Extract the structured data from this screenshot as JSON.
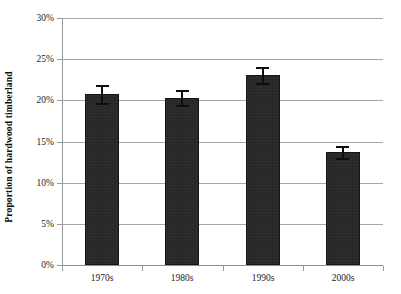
{
  "chart": {
    "title": "",
    "y_axis_title": "Proportion of hardwood timberland",
    "x_axis_title": ""
  },
  "y_ticks": [
    {
      "label": "30%",
      "value": 30
    },
    {
      "label": "25%",
      "value": 25
    },
    {
      "label": "20%",
      "value": 20
    },
    {
      "label": "15%",
      "value": 15
    },
    {
      "label": "10%",
      "value": 10
    },
    {
      "label": "5%",
      "value": 5
    },
    {
      "label": "0%",
      "value": 0
    }
  ],
  "x_labels": [
    "1970s",
    "1980s",
    "1990s",
    "2000s"
  ],
  "chart_data": {
    "type": "bar",
    "title": "",
    "subtitle": "",
    "xlabel": "",
    "ylabel": "Proportion of hardwood timberland",
    "categories": [
      "1970s",
      "1980s",
      "1990s",
      "2000s"
    ],
    "values": [
      20.8,
      20.3,
      23.1,
      13.7
    ],
    "errors": [
      1.1,
      0.9,
      1.0,
      0.7
    ],
    "error_type": "symmetric",
    "unit": "percent",
    "ylim": [
      0,
      30
    ],
    "ytick_values": [
      0,
      5,
      10,
      15,
      20,
      25,
      30
    ],
    "ytick_labels": [
      "0%",
      "5%",
      "10%",
      "15%",
      "20%",
      "25%",
      "30%"
    ],
    "grid": "horizontal",
    "legend": "none",
    "bar_color": "#262626",
    "gridline_color": "#a8a8a8",
    "background_color": "#ffffff",
    "series": [
      {
        "name": "Proportion of hardwood timberland",
        "values": [
          20.8,
          20.3,
          23.1,
          13.7
        ],
        "errors": [
          1.1,
          0.9,
          1.0,
          0.7
        ]
      }
    ]
  },
  "colors": {
    "bar": "#262626",
    "grid": "#a8a8a8",
    "axis": "#9a9a9a",
    "text": "#1a1a1a",
    "error": "#0d0d0d"
  }
}
